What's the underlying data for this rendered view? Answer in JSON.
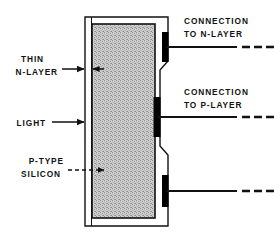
{
  "figure": {
    "colors": {
      "ink": "#111111",
      "silicon_fill": "#c9c9c9",
      "background": "#ffffff",
      "contact_pad": "#000000"
    }
  },
  "labels": {
    "thin_n_layer": {
      "line1": "THIN",
      "line2": "N-LAYER"
    },
    "light": {
      "line1": "LIGHT"
    },
    "p_type_silicon": {
      "line1": "P-TYPE",
      "line2": "SILICON"
    },
    "connection_n": {
      "line1": "CONNECTION",
      "line2": "TO N-LAYER"
    },
    "connection_p": {
      "line1": "CONNECTION",
      "line2": "TO P-LAYER"
    }
  },
  "regions": {
    "silicon_body": "P-TYPE SILICON",
    "n_layer_strip": "THIN N-LAYER"
  },
  "contacts": [
    {
      "id": "n-layer-contact",
      "label": "CONNECTION TO N-LAYER",
      "position": "upper-right"
    },
    {
      "id": "p-layer-contact",
      "label": "CONNECTION TO P-LAYER",
      "position": "middle-right"
    },
    {
      "id": "lower-contact",
      "label": "",
      "position": "lower-right"
    }
  ],
  "leaders": {
    "thin_n_layer_style": "solid-arrow",
    "light_style": "solid-arrow",
    "p_type_silicon_style": "dashed-arrow"
  }
}
